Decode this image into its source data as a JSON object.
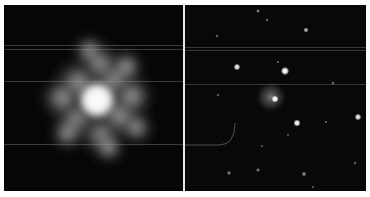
{
  "figure": {
    "panels": [
      {
        "id": "left",
        "description": "Saturated bright star with diffuse irregular halo",
        "core": {
          "x": 93,
          "y": 95,
          "radius": 12
        },
        "halo_radius": 52,
        "scanlines_y": [
          40,
          44,
          76,
          139
        ]
      },
      {
        "id": "right",
        "description": "Star field with central star surrounded by faint nebulous halo",
        "central_halo": {
          "x": 86,
          "y": 92,
          "radius": 16
        },
        "stars": [
          {
            "x": 100,
            "y": 66,
            "r": 3.0,
            "b": 1.0
          },
          {
            "x": 90,
            "y": 94,
            "r": 2.6,
            "b": 1.0
          },
          {
            "x": 112,
            "y": 118,
            "r": 2.6,
            "b": 0.95
          },
          {
            "x": 52,
            "y": 62,
            "r": 2.4,
            "b": 0.9
          },
          {
            "x": 173,
            "y": 112,
            "r": 2.4,
            "b": 0.9
          },
          {
            "x": 121,
            "y": 25,
            "r": 1.8,
            "b": 0.7
          },
          {
            "x": 73,
            "y": 6,
            "r": 1.4,
            "b": 0.5
          },
          {
            "x": 82,
            "y": 15,
            "r": 1.2,
            "b": 0.4
          },
          {
            "x": 148,
            "y": 78,
            "r": 1.3,
            "b": 0.4
          },
          {
            "x": 32,
            "y": 31,
            "r": 1.2,
            "b": 0.4
          },
          {
            "x": 33,
            "y": 90,
            "r": 1.2,
            "b": 0.35
          },
          {
            "x": 93,
            "y": 57,
            "r": 1.1,
            "b": 0.35
          },
          {
            "x": 141,
            "y": 117,
            "r": 1.1,
            "b": 0.35
          },
          {
            "x": 44,
            "y": 168,
            "r": 1.6,
            "b": 0.45
          },
          {
            "x": 73,
            "y": 165,
            "r": 1.5,
            "b": 0.45
          },
          {
            "x": 119,
            "y": 169,
            "r": 1.7,
            "b": 0.5
          },
          {
            "x": 170,
            "y": 158,
            "r": 1.3,
            "b": 0.35
          },
          {
            "x": 77,
            "y": 141,
            "r": 1.1,
            "b": 0.3
          },
          {
            "x": 103,
            "y": 130,
            "r": 1.0,
            "b": 0.3
          },
          {
            "x": 128,
            "y": 182,
            "r": 1.1,
            "b": 0.3
          }
        ],
        "scanlines_y": [
          42,
          45,
          79
        ],
        "arc": {
          "from": [
            0,
            140
          ],
          "to": [
            50,
            118
          ]
        }
      }
    ]
  }
}
